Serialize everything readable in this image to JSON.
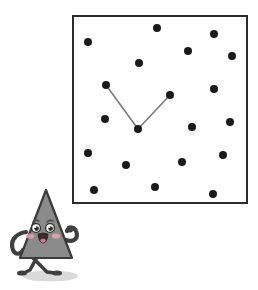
{
  "scene": {
    "title": "Clock puzzle illustration with cartoon triangle character",
    "background_color": "#ffffff",
    "width": 258,
    "height": 290
  },
  "clock_panel": {
    "name": "dotted-clock-face-panel",
    "shape": "square",
    "x": 72,
    "y": 15,
    "width": 176,
    "height": 189,
    "border_color": "#2b2b2b",
    "border_width": 2,
    "fill_color": "#ffffff"
  },
  "dots": {
    "name": "clock-hour-dots",
    "color": "#1a1a1a",
    "radius": 4,
    "count": 19,
    "points": [
      {
        "id": "dot-1",
        "x": 157,
        "y": 28
      },
      {
        "id": "dot-2",
        "x": 214,
        "y": 34
      },
      {
        "id": "dot-3",
        "x": 88,
        "y": 42
      },
      {
        "id": "dot-4",
        "x": 188,
        "y": 51
      },
      {
        "id": "dot-5",
        "x": 232,
        "y": 56
      },
      {
        "id": "dot-6",
        "x": 139,
        "y": 63
      },
      {
        "id": "dot-7",
        "x": 106,
        "y": 85
      },
      {
        "id": "dot-8",
        "x": 214,
        "y": 89
      },
      {
        "id": "dot-9",
        "x": 170,
        "y": 95
      },
      {
        "id": "dot-10",
        "x": 105,
        "y": 119
      },
      {
        "id": "dot-11",
        "x": 230,
        "y": 122
      },
      {
        "id": "dot-12",
        "x": 192,
        "y": 127
      },
      {
        "id": "dot-13",
        "x": 138,
        "y": 129
      },
      {
        "id": "dot-14",
        "x": 88,
        "y": 153
      },
      {
        "id": "dot-15",
        "x": 223,
        "y": 155
      },
      {
        "id": "dot-16",
        "x": 182,
        "y": 162
      },
      {
        "id": "dot-17",
        "x": 126,
        "y": 165
      },
      {
        "id": "dot-18",
        "x": 94,
        "y": 190
      },
      {
        "id": "dot-19",
        "x": 155,
        "y": 187
      },
      {
        "id": "dot-20",
        "x": 213,
        "y": 194
      }
    ]
  },
  "clock_hands": {
    "name": "clock-hands",
    "color": "#7a7a7a",
    "stroke_width": 1.6,
    "pivot": {
      "x": 138,
      "y": 129
    },
    "hands": [
      {
        "id": "hand-left",
        "label": "hand-to-upper-left",
        "x": 106,
        "y": 85
      },
      {
        "id": "hand-right",
        "label": "hand-to-upper-right",
        "x": 170,
        "y": 95
      }
    ]
  },
  "character": {
    "name": "triangle-character",
    "body_fill": "#8a8a8a",
    "body_stroke": "#3a3a3a",
    "limb_color": "#3f3f3f",
    "eye_white": "#ffffff",
    "eye_black": "#2b2b2b",
    "cheek_color": "#e8a0ae",
    "mouth_color": "#3a2a2a",
    "tongue_color": "#c87a86",
    "shadow_color": "#d9d9d9",
    "apex": {
      "x": 46,
      "y": 190
    },
    "base_left": {
      "x": 20,
      "y": 258
    },
    "base_right": {
      "x": 72,
      "y": 258
    },
    "expression": "smiling",
    "pose": "walking-with-raised-right-arm"
  }
}
